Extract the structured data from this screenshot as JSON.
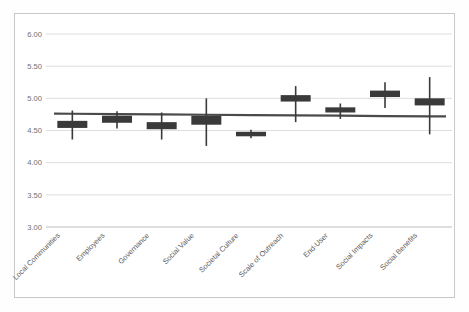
{
  "chart_data": {
    "type": "bar",
    "title": "",
    "subtitle": "",
    "xlabel": "",
    "ylabel": "",
    "ylim": [
      3.0,
      6.0
    ],
    "ytick_values": [
      3.0,
      3.5,
      4.0,
      4.5,
      5.0,
      5.5,
      6.0
    ],
    "ytick_labels": [
      "3.00",
      "3.50",
      "4.00",
      "4.50",
      "5.00",
      "5.50",
      "6.00"
    ],
    "grid": true,
    "legend": "none",
    "categories": [
      "Local Communities",
      "Employees",
      "Governance",
      "Social Value",
      "Societal Culture",
      "Scale of Outreach",
      "End-User",
      "Social Impacts",
      "Social Benefits"
    ],
    "series": [
      {
        "name": "Mean",
        "values": [
          4.59,
          4.68,
          4.57,
          4.66,
          4.44,
          5.0,
          4.82,
          5.07,
          4.95
        ]
      },
      {
        "name": "Range low",
        "values": [
          4.36,
          4.53,
          4.36,
          4.26,
          4.38,
          4.63,
          4.68,
          4.85,
          4.44
        ]
      },
      {
        "name": "Range high",
        "values": [
          4.81,
          4.8,
          4.78,
          5.0,
          4.51,
          5.19,
          4.92,
          5.25,
          5.33
        ]
      },
      {
        "name": "Box low",
        "values": [
          4.54,
          4.62,
          4.52,
          4.59,
          4.41,
          4.95,
          4.78,
          5.02,
          4.89
        ]
      },
      {
        "name": "Box high",
        "values": [
          4.65,
          4.73,
          4.63,
          4.73,
          4.48,
          5.05,
          4.86,
          5.12,
          5.0
        ]
      },
      {
        "name": "Trend line",
        "values": [
          4.76,
          4.755,
          4.75,
          4.745,
          4.74,
          4.735,
          4.73,
          4.725,
          4.72
        ]
      }
    ],
    "colors": {
      "marker": "#3a3a3a",
      "trendline": "#4a4a4a",
      "gridline": "#dadada",
      "axis": "#bdbdbd",
      "background": "#ffffff",
      "tick_text": "#6f6f6f"
    }
  }
}
